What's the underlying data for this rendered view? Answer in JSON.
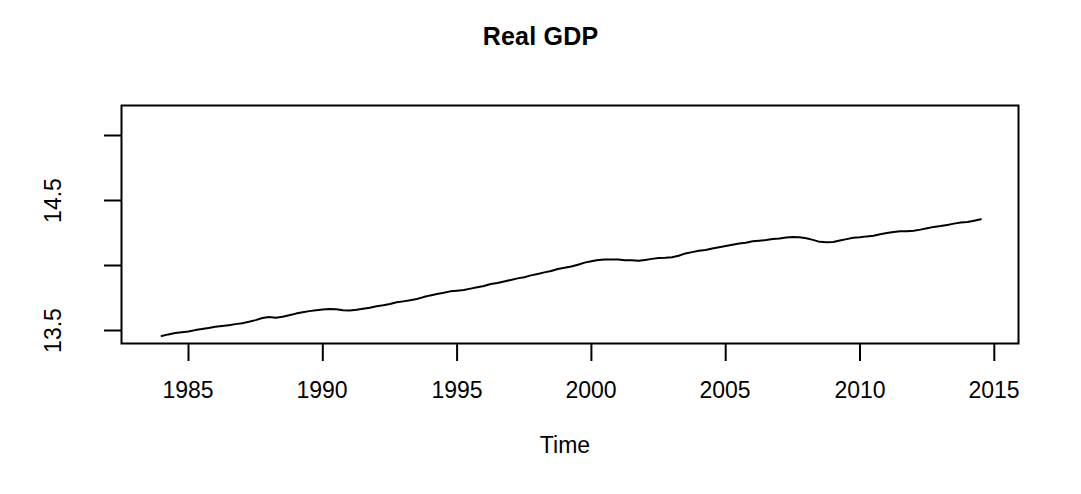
{
  "chart_data": {
    "type": "line",
    "title": "Real GDP",
    "xlabel": "Time",
    "ylabel": "",
    "xlim": [
      1983.6,
      2014.9
    ],
    "ylim": [
      13.4,
      15.17
    ],
    "grid": false,
    "legend": null,
    "xticks": [
      1985,
      1990,
      1995,
      2000,
      2005,
      2010,
      2015
    ],
    "xtick_labels": [
      "1985",
      "1990",
      "1995",
      "2000",
      "2005",
      "2010",
      "2015"
    ],
    "yticks": [
      13.5,
      14.0,
      14.5,
      15.0
    ],
    "ytick_labels": [
      "13.5",
      "",
      "14.5",
      ""
    ],
    "series": [
      {
        "name": "Real GDP (log)",
        "color": "#000000",
        "x": [
          1984.0,
          1984.25,
          1984.5,
          1984.75,
          1985.0,
          1985.25,
          1985.5,
          1985.75,
          1986.0,
          1986.25,
          1986.5,
          1986.75,
          1987.0,
          1987.25,
          1987.5,
          1987.75,
          1988.0,
          1988.25,
          1988.5,
          1988.75,
          1989.0,
          1989.25,
          1989.5,
          1989.75,
          1990.0,
          1990.25,
          1990.5,
          1990.75,
          1991.0,
          1991.25,
          1991.5,
          1991.75,
          1992.0,
          1992.25,
          1992.5,
          1992.75,
          1993.0,
          1993.25,
          1993.5,
          1993.75,
          1994.0,
          1994.25,
          1994.5,
          1994.75,
          1995.0,
          1995.25,
          1995.5,
          1995.75,
          1996.0,
          1996.25,
          1996.5,
          1996.75,
          1997.0,
          1997.25,
          1997.5,
          1997.75,
          1998.0,
          1998.25,
          1998.5,
          1998.75,
          1999.0,
          1999.25,
          1999.5,
          1999.75,
          2000.0,
          2000.25,
          2000.5,
          2000.75,
          2001.0,
          2001.25,
          2001.5,
          2001.75,
          2002.0,
          2002.25,
          2002.5,
          2002.75,
          2003.0,
          2003.25,
          2003.5,
          2003.75,
          2004.0,
          2004.25,
          2004.5,
          2004.75,
          2005.0,
          2005.25,
          2005.5,
          2005.75,
          2006.0,
          2006.25,
          2006.5,
          2006.75,
          2007.0,
          2007.25,
          2007.5,
          2007.75,
          2008.0,
          2008.25,
          2008.5,
          2008.75,
          2009.0,
          2009.25,
          2009.5,
          2009.75,
          2010.0,
          2010.25,
          2010.5,
          2010.75,
          2011.0,
          2011.25,
          2011.5,
          2011.75,
          2012.0,
          2012.25,
          2012.5,
          2012.75,
          2013.0,
          2013.25,
          2013.5,
          2013.75,
          2014.0,
          2014.25,
          2014.5
        ],
        "y": [
          13.458,
          13.47,
          13.48,
          13.487,
          13.492,
          13.503,
          13.512,
          13.52,
          13.528,
          13.534,
          13.541,
          13.549,
          13.556,
          13.567,
          13.58,
          13.596,
          13.604,
          13.598,
          13.606,
          13.618,
          13.63,
          13.64,
          13.649,
          13.655,
          13.661,
          13.665,
          13.663,
          13.656,
          13.654,
          13.659,
          13.667,
          13.675,
          13.686,
          13.694,
          13.704,
          13.717,
          13.724,
          13.732,
          13.742,
          13.757,
          13.77,
          13.781,
          13.79,
          13.801,
          13.806,
          13.812,
          13.822,
          13.832,
          13.843,
          13.857,
          13.866,
          13.877,
          13.889,
          13.901,
          13.91,
          13.924,
          13.935,
          13.947,
          13.958,
          13.973,
          13.983,
          13.993,
          14.006,
          14.022,
          14.032,
          14.042,
          14.046,
          14.047,
          14.046,
          14.041,
          14.04,
          14.036,
          14.043,
          14.051,
          14.058,
          14.06,
          14.064,
          14.075,
          14.093,
          14.103,
          14.113,
          14.12,
          14.13,
          14.141,
          14.15,
          14.16,
          14.169,
          14.175,
          14.186,
          14.191,
          14.196,
          14.203,
          14.208,
          14.215,
          14.22,
          14.218,
          14.21,
          14.197,
          14.182,
          14.179,
          14.181,
          14.192,
          14.203,
          14.213,
          14.217,
          14.224,
          14.229,
          14.241,
          14.25,
          14.257,
          14.263,
          14.264,
          14.268,
          14.276,
          14.286,
          14.297,
          14.303,
          14.312,
          14.322,
          14.331,
          14.334,
          14.345,
          14.356
        ]
      }
    ]
  },
  "axes": {
    "title": "Real GDP",
    "x_axis_label": "Time",
    "x_tick_labels": [
      "1985",
      "1990",
      "1995",
      "2000",
      "2005",
      "2010",
      "2015"
    ],
    "y_tick_labels": [
      "14.5",
      "13.5"
    ]
  }
}
